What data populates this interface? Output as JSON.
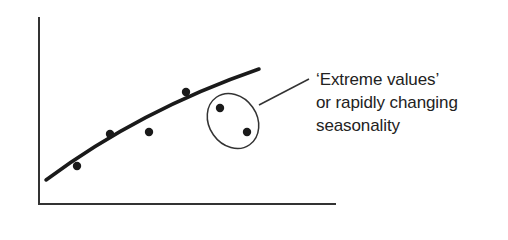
{
  "diagram": {
    "type": "scatter-with-trend",
    "axes": {
      "x_label": "",
      "y_label": ""
    },
    "trend_line": "fitted curve",
    "points": [
      {
        "x": 77,
        "y": 166,
        "group": "normal"
      },
      {
        "x": 110,
        "y": 134,
        "group": "normal"
      },
      {
        "x": 149,
        "y": 132,
        "group": "normal"
      },
      {
        "x": 186,
        "y": 92,
        "group": "normal"
      },
      {
        "x": 220,
        "y": 108,
        "group": "outlier"
      },
      {
        "x": 247,
        "y": 132,
        "group": "outlier"
      }
    ],
    "annotation": {
      "lines": [
        "‘Extreme values’",
        "or rapidly changing",
        "seasonality"
      ]
    },
    "colors": {
      "ink": "#222222",
      "background": "#ffffff"
    }
  }
}
